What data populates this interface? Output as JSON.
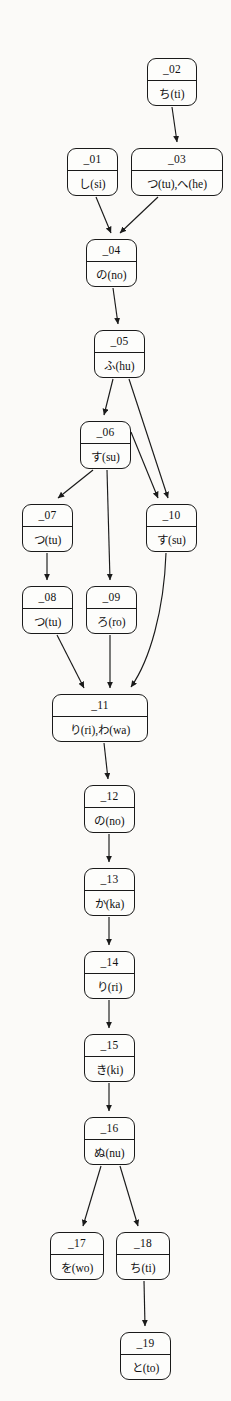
{
  "diagram": {
    "type": "directed-graph",
    "canvas": {
      "width": 231,
      "height": 1401
    },
    "style": {
      "background_color": "#fbfaf8",
      "node_fill": "#fdfdfb",
      "stroke_color": "#1a1a1a",
      "text_color": "#111111"
    },
    "nodes": [
      {
        "key": "n01",
        "id": "_01",
        "label": "し(si)",
        "x": 67,
        "y": 148,
        "w": 51,
        "h": 48
      },
      {
        "key": "n02",
        "id": "_02",
        "label": "ち(ti)",
        "x": 147,
        "y": 58,
        "w": 50,
        "h": 48
      },
      {
        "key": "n03",
        "id": "_03",
        "label": "つ(tu),へ(he)",
        "x": 131,
        "y": 148,
        "w": 92,
        "h": 48
      },
      {
        "key": "n04",
        "id": "_04",
        "label": "の(no)",
        "x": 86,
        "y": 239,
        "w": 51,
        "h": 48
      },
      {
        "key": "n05",
        "id": "_05",
        "label": "ふ(hu)",
        "x": 94,
        "y": 330,
        "w": 51,
        "h": 48
      },
      {
        "key": "n06",
        "id": "_06",
        "label": "す(su)",
        "x": 80,
        "y": 421,
        "w": 51,
        "h": 48
      },
      {
        "key": "n07",
        "id": "_07",
        "label": "つ(tu)",
        "x": 22,
        "y": 504,
        "w": 51,
        "h": 48
      },
      {
        "key": "n08",
        "id": "_08",
        "label": "つ(tu)",
        "x": 22,
        "y": 586,
        "w": 51,
        "h": 48
      },
      {
        "key": "n09",
        "id": "_09",
        "label": "ろ(ro)",
        "x": 86,
        "y": 586,
        "w": 51,
        "h": 48
      },
      {
        "key": "n10",
        "id": "_10",
        "label": "す(su)",
        "x": 146,
        "y": 504,
        "w": 51,
        "h": 48
      },
      {
        "key": "n11",
        "id": "_11",
        "label": "り(ri),わ(wa)",
        "x": 52,
        "y": 694,
        "w": 96,
        "h": 48
      },
      {
        "key": "n12",
        "id": "_12",
        "label": "の(no)",
        "x": 84,
        "y": 785,
        "w": 51,
        "h": 48
      },
      {
        "key": "n13",
        "id": "_13",
        "label": "か(ka)",
        "x": 84,
        "y": 868,
        "w": 51,
        "h": 48
      },
      {
        "key": "n14",
        "id": "_14",
        "label": "り(ri)",
        "x": 84,
        "y": 951,
        "w": 51,
        "h": 48
      },
      {
        "key": "n15",
        "id": "_15",
        "label": "き(ki)",
        "x": 84,
        "y": 1034,
        "w": 51,
        "h": 48
      },
      {
        "key": "n16",
        "id": "_16",
        "label": "ぬ(nu)",
        "x": 84,
        "y": 1117,
        "w": 51,
        "h": 48
      },
      {
        "key": "n17",
        "id": "_17",
        "label": "を(wo)",
        "x": 50,
        "y": 1232,
        "w": 54,
        "h": 48
      },
      {
        "key": "n18",
        "id": "_18",
        "label": "ち(ti)",
        "x": 116,
        "y": 1232,
        "w": 54,
        "h": 48
      },
      {
        "key": "n19",
        "id": "_19",
        "label": "と(to)",
        "x": 120,
        "y": 1332,
        "w": 51,
        "h": 48
      }
    ],
    "edges": [
      {
        "from": "_02",
        "to": "_03",
        "shape": "straight"
      },
      {
        "from": "_01",
        "to": "_04",
        "shape": "straight"
      },
      {
        "from": "_03",
        "to": "_04",
        "shape": "straight"
      },
      {
        "from": "_04",
        "to": "_05",
        "shape": "straight"
      },
      {
        "from": "_05",
        "to": "_06",
        "shape": "straight"
      },
      {
        "from": "_05",
        "to": "_10",
        "shape": "long-diagonal"
      },
      {
        "from": "_06",
        "to": "_07",
        "shape": "straight"
      },
      {
        "from": "_06",
        "to": "_09",
        "shape": "straight"
      },
      {
        "from": "_06",
        "to": "_10",
        "shape": "straight"
      },
      {
        "from": "_07",
        "to": "_08",
        "shape": "straight"
      },
      {
        "from": "_08",
        "to": "_11",
        "shape": "straight"
      },
      {
        "from": "_09",
        "to": "_11",
        "shape": "straight"
      },
      {
        "from": "_10",
        "to": "_11",
        "shape": "curved"
      },
      {
        "from": "_11",
        "to": "_12",
        "shape": "straight"
      },
      {
        "from": "_12",
        "to": "_13",
        "shape": "straight"
      },
      {
        "from": "_13",
        "to": "_14",
        "shape": "straight"
      },
      {
        "from": "_14",
        "to": "_15",
        "shape": "straight"
      },
      {
        "from": "_15",
        "to": "_16",
        "shape": "straight"
      },
      {
        "from": "_16",
        "to": "_17",
        "shape": "straight"
      },
      {
        "from": "_16",
        "to": "_18",
        "shape": "straight"
      },
      {
        "from": "_18",
        "to": "_19",
        "shape": "straight"
      }
    ]
  }
}
